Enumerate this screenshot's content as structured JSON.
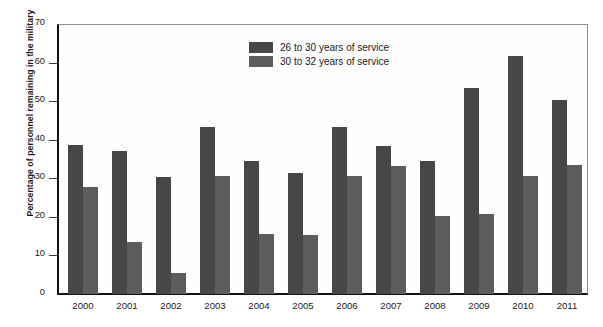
{
  "chart_data": {
    "type": "bar",
    "title": "",
    "xlabel": "",
    "ylabel": "Percentage of personnel remaining in the military",
    "categories": [
      "2000",
      "2001",
      "2002",
      "2003",
      "2004",
      "2005",
      "2006",
      "2007",
      "2008",
      "2009",
      "2010",
      "2011"
    ],
    "series": [
      {
        "name": "26 to 30 years of service",
        "color": "#474747",
        "values": [
          38.7,
          37.1,
          30.4,
          43.4,
          34.4,
          31.3,
          43.4,
          38.4,
          34.5,
          53.5,
          61.8,
          50.3
        ]
      },
      {
        "name": "30 to 32 years of service",
        "color": "#5d5d5d",
        "values": [
          27.7,
          13.4,
          5.5,
          30.5,
          15.6,
          15.2,
          30.6,
          33.3,
          20.2,
          20.7,
          30.7,
          33.4
        ]
      }
    ],
    "ylim": [
      0,
      70
    ],
    "yticks": [
      0,
      10,
      20,
      30,
      40,
      50,
      60,
      70
    ],
    "ytick_labels": [
      "0",
      "10",
      "20",
      "30",
      "40",
      "50",
      "60",
      "70"
    ],
    "grid": false,
    "legend_position": "upper center"
  },
  "legend": {
    "items": [
      {
        "label": "26 to 30 years of service",
        "color": "#474747"
      },
      {
        "label": "30 to 32 years of service",
        "color": "#5d5d5d"
      }
    ]
  }
}
